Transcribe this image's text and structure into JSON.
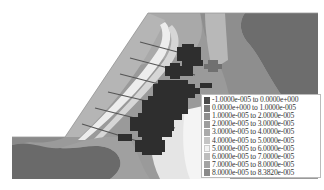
{
  "figure": {
    "legend": {
      "entries": [
        {
          "label": "-1.0000e-005 to  0.0000e+000",
          "color": "#4a4a4a"
        },
        {
          "label": " 0.0000e+000 to  1.0000e-005",
          "color": "#7a7a7a"
        },
        {
          "label": " 1.0000e-005 to  2.0000e-005",
          "color": "#8f8f8f"
        },
        {
          "label": " 2.0000e-005 to  3.0000e-005",
          "color": "#9d9d9d"
        },
        {
          "label": " 3.0000e-005 to  4.0000e-005",
          "color": "#aaaaaa"
        },
        {
          "label": " 4.0000e-005 to  5.0000e-005",
          "color": "#c4c4c4"
        },
        {
          "label": " 5.0000e-005 to  6.0000e-005",
          "color": "#f2f2f2"
        },
        {
          "label": " 6.0000e-005 to  7.0000e-005",
          "color": "#bdbdbd"
        },
        {
          "label": " 7.0000e-005 to  8.0000e-005",
          "color": "#a3a3a3"
        },
        {
          "label": " 8.0000e-005 to  8.3820e-005",
          "color": "#8a8a8a"
        }
      ]
    }
  }
}
